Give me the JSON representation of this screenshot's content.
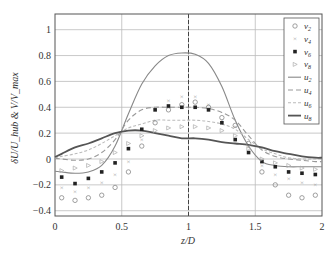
{
  "chart_data": {
    "type": "line",
    "title": "",
    "xlabel": "z/D",
    "ylabel": "δU/U_hub & V/V_max",
    "xlim": [
      0,
      2
    ],
    "ylim": [
      -0.45,
      1.15
    ],
    "xticks": [
      "0",
      "0.5",
      "1",
      "1.5",
      "2"
    ],
    "yticks": [
      "-0.4",
      "-0.2",
      "0",
      "0.2",
      "0.4",
      "0.6",
      "0.8",
      "1"
    ],
    "grid": true,
    "vline": 1,
    "legend_position": "upper right",
    "legend": [
      "v2",
      "v4",
      "v6",
      "v8",
      "u2",
      "u4",
      "u6",
      "u8"
    ],
    "x": [
      0.05,
      0.15,
      0.25,
      0.35,
      0.45,
      0.55,
      0.65,
      0.75,
      0.85,
      0.95,
      1.05,
      1.15,
      1.25,
      1.35,
      1.45,
      1.55,
      1.65,
      1.75,
      1.85,
      1.95
    ],
    "series": [
      {
        "name": "v2",
        "kind": "scatter",
        "marker": "circle",
        "values": [
          -0.3,
          -0.32,
          -0.3,
          -0.28,
          -0.22,
          -0.1,
          0.1,
          0.28,
          0.38,
          0.42,
          0.44,
          0.4,
          0.32,
          0.26,
          0.12,
          -0.1,
          -0.2,
          -0.28,
          -0.3,
          -0.28
        ]
      },
      {
        "name": "v4",
        "kind": "scatter",
        "marker": "x",
        "values": [
          -0.22,
          -0.25,
          -0.22,
          -0.18,
          -0.12,
          -0.02,
          0.15,
          0.3,
          0.45,
          0.48,
          0.48,
          0.42,
          0.3,
          0.25,
          0.1,
          -0.05,
          -0.12,
          -0.15,
          -0.18,
          -0.2
        ]
      },
      {
        "name": "v6",
        "kind": "scatter",
        "marker": "square",
        "values": [
          -0.14,
          -0.19,
          -0.15,
          -0.1,
          -0.03,
          0.08,
          0.23,
          0.38,
          0.41,
          0.4,
          0.4,
          0.38,
          0.28,
          0.15,
          0.05,
          -0.02,
          -0.06,
          -0.1,
          -0.11,
          -0.12
        ]
      },
      {
        "name": "v8",
        "kind": "scatter",
        "marker": "triangle",
        "values": [
          -0.09,
          -0.07,
          -0.05,
          -0.02,
          0.05,
          0.12,
          0.18,
          0.22,
          0.24,
          0.25,
          0.25,
          0.24,
          0.22,
          0.18,
          0.08,
          0.0,
          -0.03,
          -0.05,
          -0.07,
          -0.08
        ]
      },
      {
        "name": "u2",
        "kind": "line",
        "style": "solid-thin",
        "values": [
          -0.1,
          -0.11,
          -0.1,
          -0.05,
          0.1,
          0.35,
          0.58,
          0.72,
          0.8,
          0.82,
          0.81,
          0.74,
          0.56,
          0.3,
          0.1,
          -0.02,
          -0.05,
          -0.06,
          -0.06,
          -0.06
        ]
      },
      {
        "name": "u4",
        "kind": "line",
        "style": "dashed",
        "values": [
          0.0,
          -0.01,
          0.0,
          0.05,
          0.15,
          0.3,
          0.38,
          0.4,
          0.4,
          0.4,
          0.4,
          0.39,
          0.36,
          0.3,
          0.18,
          0.07,
          0.02,
          0.0,
          -0.01,
          -0.02
        ]
      },
      {
        "name": "u6",
        "kind": "line",
        "style": "dotted-dashed",
        "values": [
          0.02,
          0.04,
          0.07,
          0.12,
          0.18,
          0.24,
          0.27,
          0.3,
          0.3,
          0.3,
          0.3,
          0.29,
          0.27,
          0.23,
          0.15,
          0.08,
          0.04,
          0.01,
          0.0,
          0.0
        ]
      },
      {
        "name": "u8",
        "kind": "line",
        "style": "solid-thick",
        "values": [
          0.04,
          0.09,
          0.12,
          0.16,
          0.2,
          0.22,
          0.22,
          0.2,
          0.18,
          0.16,
          0.16,
          0.15,
          0.13,
          0.12,
          0.11,
          0.09,
          0.06,
          0.04,
          0.02,
          0.01
        ]
      }
    ]
  }
}
